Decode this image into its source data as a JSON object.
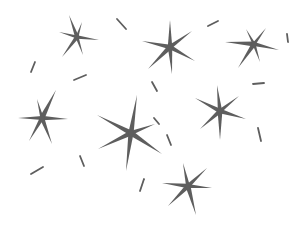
{
  "canvas": {
    "width": 307,
    "height": 234,
    "background": "#ffffff"
  },
  "colors": {
    "ink": "#5e5e5e"
  },
  "stars": [
    {
      "name": "star-top-left",
      "cx": 77,
      "cy": 37,
      "rays": [
        [
          -8,
          -22
        ],
        [
          5,
          -15
        ],
        [
          22,
          3
        ],
        [
          -18,
          -5
        ],
        [
          -15,
          20
        ],
        [
          6,
          18
        ]
      ]
    },
    {
      "name": "star-top-center",
      "cx": 170,
      "cy": 47,
      "rays": [
        [
          0,
          -27
        ],
        [
          22,
          -16
        ],
        [
          25,
          14
        ],
        [
          -28,
          -6
        ],
        [
          -22,
          22
        ],
        [
          2,
          27
        ]
      ]
    },
    {
      "name": "star-top-right",
      "cx": 254,
      "cy": 44,
      "rays": [
        [
          -8,
          -15
        ],
        [
          12,
          -16
        ],
        [
          25,
          6
        ],
        [
          -29,
          -2
        ],
        [
          -16,
          24
        ],
        [
          6,
          18
        ]
      ]
    },
    {
      "name": "star-mid-left",
      "cx": 42,
      "cy": 118,
      "rays": [
        [
          -5,
          -19
        ],
        [
          14,
          -28
        ],
        [
          26,
          1
        ],
        [
          -24,
          0
        ],
        [
          -13,
          23
        ],
        [
          10,
          26
        ]
      ]
    },
    {
      "name": "star-center-large",
      "cx": 131,
      "cy": 133,
      "rays": [
        [
          6,
          -38
        ],
        [
          24,
          -9
        ],
        [
          31,
          21
        ],
        [
          -34,
          -18
        ],
        [
          -33,
          16
        ],
        [
          -5,
          38
        ]
      ]
    },
    {
      "name": "star-mid-right",
      "cx": 220,
      "cy": 111,
      "rays": [
        [
          -3,
          -26
        ],
        [
          19,
          -15
        ],
        [
          26,
          8
        ],
        [
          -25,
          -13
        ],
        [
          -20,
          18
        ],
        [
          0,
          29
        ]
      ]
    },
    {
      "name": "star-bottom-center",
      "cx": 188,
      "cy": 186,
      "rays": [
        [
          -5,
          -23
        ],
        [
          19,
          -18
        ],
        [
          24,
          2
        ],
        [
          -26,
          -3
        ],
        [
          -20,
          20
        ],
        [
          8,
          29
        ]
      ]
    }
  ],
  "dashes": [
    {
      "x1": 117,
      "y1": 19,
      "x2": 126,
      "y2": 29
    },
    {
      "x1": 208,
      "y1": 26,
      "x2": 218,
      "y2": 21
    },
    {
      "x1": 287,
      "y1": 34,
      "x2": 288,
      "y2": 42
    },
    {
      "x1": 31,
      "y1": 72,
      "x2": 35,
      "y2": 62
    },
    {
      "x1": 74,
      "y1": 80,
      "x2": 86,
      "y2": 75
    },
    {
      "x1": 152,
      "y1": 82,
      "x2": 157,
      "y2": 91
    },
    {
      "x1": 253,
      "y1": 84,
      "x2": 264,
      "y2": 83
    },
    {
      "x1": 80,
      "y1": 156,
      "x2": 84,
      "y2": 166
    },
    {
      "x1": 167,
      "y1": 135,
      "x2": 171,
      "y2": 145
    },
    {
      "x1": 258,
      "y1": 128,
      "x2": 261,
      "y2": 141
    },
    {
      "x1": 31,
      "y1": 174,
      "x2": 43,
      "y2": 167
    },
    {
      "x1": 140,
      "y1": 191,
      "x2": 144,
      "y2": 179
    },
    {
      "x1": 154,
      "y1": 118,
      "x2": 159,
      "y2": 124
    }
  ]
}
